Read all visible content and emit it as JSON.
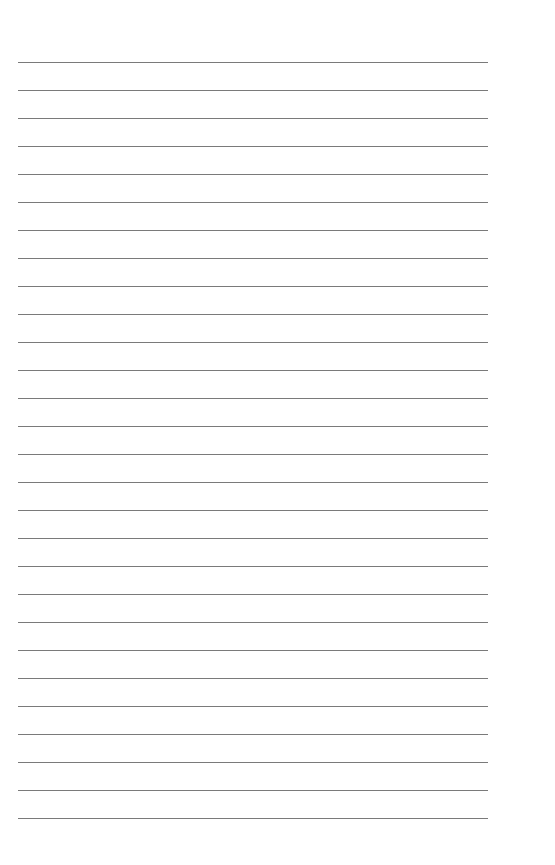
{
  "page": {
    "type": "lined-paper",
    "line_count": 28,
    "line_color": "#7a7a7a",
    "background": "#ffffff",
    "first_line_y": 62,
    "line_spacing": 28,
    "line_left": 18,
    "line_width": 470
  }
}
